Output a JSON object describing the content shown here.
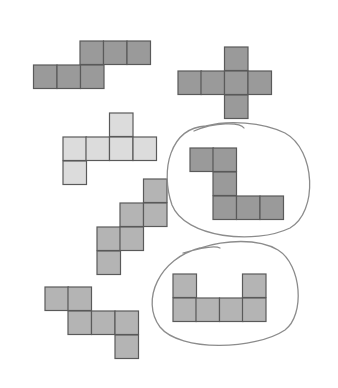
{
  "figure": {
    "cell_size": 23.5,
    "colors": {
      "dark": "#9a9a9a",
      "medium": "#b4b4b4",
      "light": "#dcdcdc",
      "border": "#5a5a5a",
      "circle": "#8c8c8c"
    },
    "shapes": [
      {
        "id": "net-1",
        "shade": "dark",
        "circled": false,
        "cells": [
          [
            80,
            41
          ],
          [
            103.5,
            41
          ],
          [
            127,
            41
          ],
          [
            33.5,
            65
          ],
          [
            57,
            65
          ],
          [
            80.5,
            65
          ]
        ]
      },
      {
        "id": "net-2-cross",
        "shade": "dark",
        "circled": false,
        "cells": [
          [
            224.5,
            47
          ],
          [
            178,
            71
          ],
          [
            201,
            71
          ],
          [
            224.5,
            71
          ],
          [
            248,
            71
          ],
          [
            224.5,
            95
          ]
        ]
      },
      {
        "id": "net-3",
        "shade": "light",
        "circled": false,
        "cells": [
          [
            109.5,
            113
          ],
          [
            63,
            137
          ],
          [
            86,
            137
          ],
          [
            109.5,
            137
          ],
          [
            133,
            137
          ],
          [
            63,
            161
          ]
        ]
      },
      {
        "id": "net-4",
        "shade": "dark",
        "circled": true,
        "cells": [
          [
            190,
            148
          ],
          [
            213,
            148
          ],
          [
            213,
            172
          ],
          [
            213,
            196
          ],
          [
            236.5,
            196
          ],
          [
            260,
            196
          ]
        ]
      },
      {
        "id": "net-5-staircase",
        "shade": "medium",
        "circled": false,
        "cells": [
          [
            143.5,
            179
          ],
          [
            120,
            203
          ],
          [
            143.5,
            203
          ],
          [
            97,
            227
          ],
          [
            120,
            227
          ],
          [
            97,
            251
          ]
        ]
      },
      {
        "id": "net-6",
        "shade": "medium",
        "circled": false,
        "cells": [
          [
            45,
            287
          ],
          [
            68,
            287
          ],
          [
            68,
            311
          ],
          [
            91.5,
            311
          ],
          [
            115,
            311
          ],
          [
            115,
            335
          ]
        ]
      },
      {
        "id": "net-7-u",
        "shade": "medium",
        "circled": true,
        "cells": [
          [
            173,
            274
          ],
          [
            242.5,
            274
          ],
          [
            173,
            298
          ],
          [
            196,
            298
          ],
          [
            219.5,
            298
          ],
          [
            242.5,
            298
          ]
        ]
      }
    ],
    "circles": [
      {
        "id": "circle-net-4",
        "path": "M 194 131 C 215 122, 240 122, 244 128 M 206 126 C 170 128, 160 170, 172 205 C 185 238, 255 245, 290 228 C 318 212, 316 150, 285 133 C 262 122, 228 120, 206 126"
      },
      {
        "id": "circle-net-7",
        "path": "M 183 253 C 200 248, 215 245, 220 248 M 200 248 C 160 258, 140 300, 160 327 C 180 352, 255 350, 285 330 C 305 315, 302 265, 278 250 C 258 238, 225 240, 200 248"
      }
    ]
  }
}
